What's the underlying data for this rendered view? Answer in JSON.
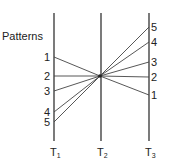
{
  "title": "Patterns",
  "axes": [
    {
      "id": "T1",
      "label": "T",
      "sub": "1"
    },
    {
      "id": "T2",
      "label": "T",
      "sub": "2"
    },
    {
      "id": "T3",
      "label": "T",
      "sub": "3"
    }
  ],
  "left_labels": [
    "1",
    "2",
    "3",
    "4",
    "5"
  ],
  "right_labels": [
    "5",
    "4",
    "3",
    "2",
    "1"
  ],
  "patterns": [
    {
      "name": "1",
      "t1_rank": 1,
      "t3_rank": 5
    },
    {
      "name": "2",
      "t1_rank": 2,
      "t3_rank": 4
    },
    {
      "name": "3",
      "t1_rank": 3,
      "t3_rank": 3
    },
    {
      "name": "4",
      "t1_rank": 4,
      "t3_rank": 2
    },
    {
      "name": "5",
      "t1_rank": 5,
      "t3_rank": 1
    }
  ],
  "convergence": "all patterns pass through a single point on T2"
}
